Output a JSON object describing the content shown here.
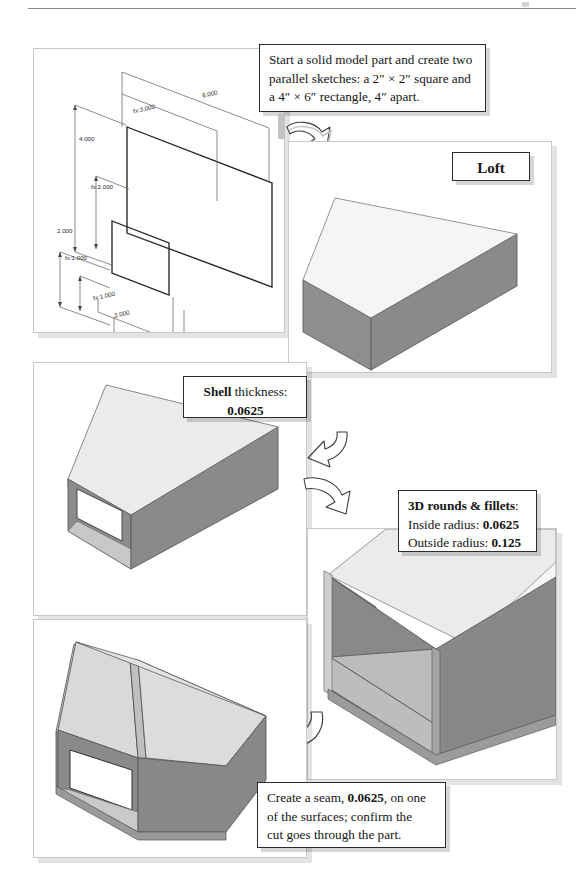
{
  "page": {
    "background_color": "#ffffff",
    "rule_color": "#8a8a8a"
  },
  "colors": {
    "panel_background": "#ffffff",
    "panel_border": "#c9c9c9",
    "callout_border": "#2b2b2b",
    "face_dark": "#8b8b8b",
    "face_mid": "#b6b6b6",
    "face_light": "#dedede",
    "face_pale": "#f0f0f0",
    "edge": "#4a4a4a",
    "shadow": "rgba(0,0,0,0.11)"
  },
  "steps": [
    {
      "id": "step-1-sketches",
      "name": "parallel-sketches",
      "callout_lines": [
        "Start a solid model part and create two",
        "parallel sketches: a 2″ × 2″ square and",
        "a 4″ × 6″ rectangle, 4″ apart."
      ]
    },
    {
      "id": "step-2-loft",
      "name": "loft",
      "callout_lines": [
        "Loft"
      ]
    },
    {
      "id": "step-3-shell",
      "name": "shell",
      "callout_lines": [
        "Shell thickness:",
        "0.0625"
      ],
      "label": "Shell",
      "label_rest": " thickness:",
      "value": "0.0625"
    },
    {
      "id": "step-4-rounds-fillets",
      "name": "rounds-and-fillets",
      "title": "3D rounds & fillets",
      "title_suffix": ":",
      "rows": [
        {
          "label": "Inside radius: ",
          "value": "0.0625"
        },
        {
          "label": "Outside radius: ",
          "value": "0.125"
        }
      ]
    },
    {
      "id": "step-5-seam",
      "name": "seam",
      "line1_a": "Create a seam, ",
      "line1_value": "0.0625",
      "line1_b": ", on one",
      "line2": "of the surfaces; confirm the",
      "line3": "cut goes through the part."
    }
  ],
  "sketch_dimensions": [
    {
      "id": "dim-6000",
      "text": "6.000",
      "x": 198,
      "y": 86,
      "rot": -13
    },
    {
      "id": "dim-fx3000",
      "text": "fx:3.000",
      "x": 132,
      "y": 101,
      "rot": -13
    },
    {
      "id": "dim-4000",
      "text": "4.000",
      "x": 78,
      "y": 134,
      "rot": 0
    },
    {
      "id": "dim-fx2000",
      "text": "fx:2.000",
      "x": 90,
      "y": 182,
      "rot": 0
    },
    {
      "id": "dim-2000-a",
      "text": "2.000",
      "x": 56,
      "y": 226,
      "rot": 0
    },
    {
      "id": "dim-fx1000-a",
      "text": "fx:1.000",
      "x": 64,
      "y": 253,
      "rot": 0
    },
    {
      "id": "dim-fx1000-b",
      "text": "fx:1.000",
      "x": 92,
      "y": 291,
      "rot": -13
    },
    {
      "id": "dim-2000-b",
      "text": "2.000",
      "x": 113,
      "y": 309,
      "rot": -13
    }
  ],
  "arrows": [
    {
      "id": "arrow-sketch-to-loft",
      "name": "arrow-sketches-to-loft",
      "direction": "down-right"
    },
    {
      "id": "arrow-loft-to-shell",
      "name": "arrow-loft-to-shell",
      "direction": "down-left"
    },
    {
      "id": "arrow-shell-to-fillets",
      "name": "arrow-shell-to-fillets",
      "direction": "down-right"
    },
    {
      "id": "arrow-fillets-to-seam",
      "name": "arrow-fillets-to-seam",
      "direction": "down-left"
    }
  ]
}
